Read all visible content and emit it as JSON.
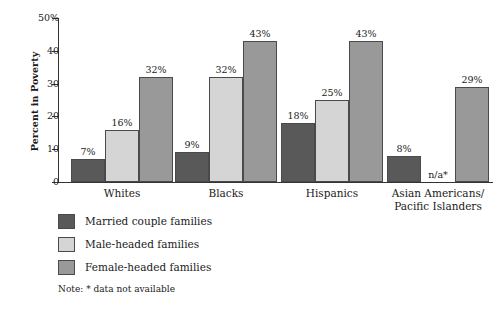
{
  "chart_data": {
    "type": "bar",
    "title": "",
    "subtitle": "",
    "xlabel": "",
    "ylabel": "Percent in Poverty",
    "ylim": [
      0,
      50
    ],
    "grid": false,
    "legend_position": "bottom-left",
    "categories": [
      "Whites",
      "Blacks",
      "Hispanics",
      "Asian Americans/\nPacific Islanders"
    ],
    "category_lines": [
      [
        "Whites"
      ],
      [
        "Blacks"
      ],
      [
        "Hispanics"
      ],
      [
        "Asian Americans/",
        "Pacific Islanders"
      ]
    ],
    "series": [
      {
        "name": "Married couple families",
        "color": "#595959",
        "values": [
          7,
          9,
          18,
          8
        ],
        "labels": [
          "7%",
          "9%",
          "18%",
          "8%"
        ]
      },
      {
        "name": "Male-headed families",
        "color": "#d5d5d5",
        "values": [
          16,
          32,
          25,
          null
        ],
        "labels": [
          "16%",
          "32%",
          "25%",
          "n/a*"
        ]
      },
      {
        "name": "Female-headed families",
        "color": "#999999",
        "values": [
          32,
          43,
          43,
          29
        ],
        "labels": [
          "32%",
          "43%",
          "43%",
          "29%"
        ]
      }
    ],
    "y_ticks": [
      {
        "value": 50,
        "label": "50%"
      },
      {
        "value": 40,
        "label": "40"
      },
      {
        "value": 30,
        "label": "30"
      },
      {
        "value": 20,
        "label": "20"
      },
      {
        "value": 10,
        "label": "10"
      },
      {
        "value": 0,
        "label": "0"
      }
    ],
    "annotations": [
      {
        "text": "n/a*",
        "note": "Male-headed families value not available for Asian Americans/Pacific Islanders"
      }
    ],
    "note": "Note: * data not available"
  },
  "legend": {
    "items": [
      {
        "label": "Married couple families",
        "color": "#595959"
      },
      {
        "label": "Male-headed families",
        "color": "#d5d5d5"
      },
      {
        "label": "Female-headed families",
        "color": "#999999"
      }
    ]
  },
  "colors": {
    "axis": "#333333",
    "bar_outline": "#4a4a4a",
    "text": "#1a1a1a",
    "background": "#ffffff",
    "series_dark": "#595959",
    "series_light": "#d5d5d5",
    "series_medium": "#999999"
  }
}
